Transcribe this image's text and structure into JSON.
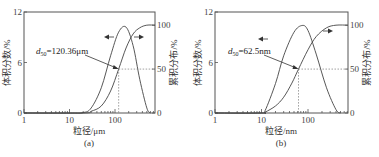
{
  "chart_data": [
    {
      "type": "line",
      "panel_label": "(a)",
      "xlabel": "粒径/μm",
      "ylabel_left": "体积分数/%",
      "ylabel_right": "累积分布/%",
      "xscale": "log",
      "xlim": [
        1,
        760
      ],
      "x_ticks": [
        "1",
        "10",
        "100"
      ],
      "ylim_left": [
        0,
        12
      ],
      "y_ticks_left": [
        "0",
        "6",
        "12"
      ],
      "ylim_right": [
        0,
        115
      ],
      "y_ticks_right": [
        "0",
        "50",
        "100"
      ],
      "annotation": {
        "text_sub": "50",
        "text_prefix": "d",
        "text_value": "=120.36μm",
        "d50": 120.36
      },
      "series": [
        {
          "name": "体积分数",
          "axis": "left",
          "x": [
            1,
            10,
            20,
            30,
            50,
            80,
            120,
            175,
            250,
            350,
            500,
            600
          ],
          "y": [
            0,
            0,
            0.05,
            0.6,
            3.0,
            6.8,
            9.6,
            10.2,
            8.0,
            4.0,
            0.6,
            0
          ]
        },
        {
          "name": "累积分布",
          "axis": "right",
          "x": [
            1,
            20,
            30,
            50,
            80,
            120.36,
            175,
            250,
            350,
            500,
            760
          ],
          "y": [
            0,
            0,
            2,
            8,
            25,
            50,
            74,
            90,
            97,
            100,
            100
          ]
        }
      ]
    },
    {
      "type": "line",
      "panel_label": "(b)",
      "xlabel": "粒径/nm",
      "ylabel_left": "体积分数/%",
      "ylabel_right": "累积分布/%",
      "xscale": "log",
      "xlim": [
        1,
        720
      ],
      "x_ticks": [
        "1",
        "10",
        "100"
      ],
      "ylim_left": [
        0,
        12
      ],
      "y_ticks_left": [
        "0",
        "6",
        "12"
      ],
      "ylim_right": [
        0,
        115
      ],
      "y_ticks_right": [
        "0",
        "50",
        "100"
      ],
      "annotation": {
        "text_sub": "50",
        "text_prefix": "d",
        "text_value": "=62.5nm",
        "d50": 62.5
      },
      "series": [
        {
          "name": "体积分数",
          "axis": "left",
          "x": [
            1,
            10,
            12,
            20,
            30,
            50,
            75,
            100,
            150,
            250,
            400,
            500
          ],
          "y": [
            0,
            0,
            0.3,
            3.5,
            6.8,
            9.6,
            10.4,
            9.8,
            7.0,
            3.0,
            0.4,
            0
          ]
        },
        {
          "name": "累积分布",
          "axis": "right",
          "x": [
            1,
            10,
            12,
            20,
            30,
            45,
            62.5,
            100,
            150,
            250,
            400,
            720
          ],
          "y": [
            0,
            0,
            1,
            8,
            18,
            34,
            50,
            72,
            87,
            97,
            100,
            100
          ]
        }
      ]
    }
  ]
}
